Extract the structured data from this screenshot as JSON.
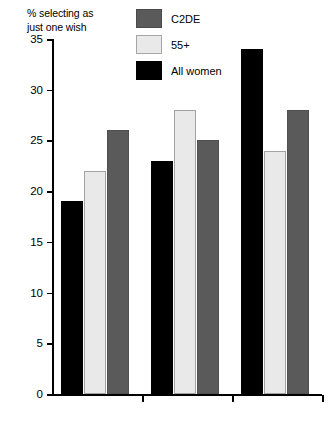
{
  "chart_data": {
    "type": "bar",
    "title": "",
    "xlabel": "",
    "ylabel": "% selecting as just one wish",
    "ylim": [
      0,
      35
    ],
    "ytick_values": [
      35,
      30,
      25,
      20,
      15,
      10,
      5,
      0
    ],
    "ytick_labels": [
      "35",
      "30",
      "25",
      "20",
      "15",
      "10",
      "5",
      "0"
    ],
    "grid": false,
    "legend_position": "top-right",
    "categories": [
      "Less fear",
      "Afford something",
      "Fulfilment"
    ],
    "category_lines": [
      [
        "Less",
        "fear"
      ],
      [
        "Afford",
        "something"
      ],
      [
        "Fulfilment"
      ]
    ],
    "series": [
      {
        "name": "C2DE",
        "color": "#5a5a5a",
        "values": [
          26,
          25,
          28
        ]
      },
      {
        "name": "55+",
        "color": "#e9e9e9",
        "values": [
          22,
          28,
          24
        ]
      },
      {
        "name": "All women",
        "color": "#000000",
        "values": [
          19,
          23,
          34
        ]
      }
    ],
    "bar_draw_order": [
      "All women",
      "55+",
      "C2DE"
    ]
  },
  "axis_caption": "% selecting as\njust one wish",
  "legend": {
    "items": [
      {
        "label": "C2DE",
        "swatch": "dark"
      },
      {
        "label": "55+",
        "swatch": "light"
      },
      {
        "label": "All women",
        "swatch": "black"
      }
    ]
  },
  "ticks": [
    {
      "label": "35"
    },
    {
      "label": "30"
    },
    {
      "label": "25"
    },
    {
      "label": "20"
    },
    {
      "label": "15"
    },
    {
      "label": "10"
    },
    {
      "label": "5"
    },
    {
      "label": "0"
    }
  ],
  "categories": [
    {
      "label": "Less\nfear"
    },
    {
      "label": "Afford\nsomething"
    },
    {
      "label": "Fulfilment"
    }
  ]
}
